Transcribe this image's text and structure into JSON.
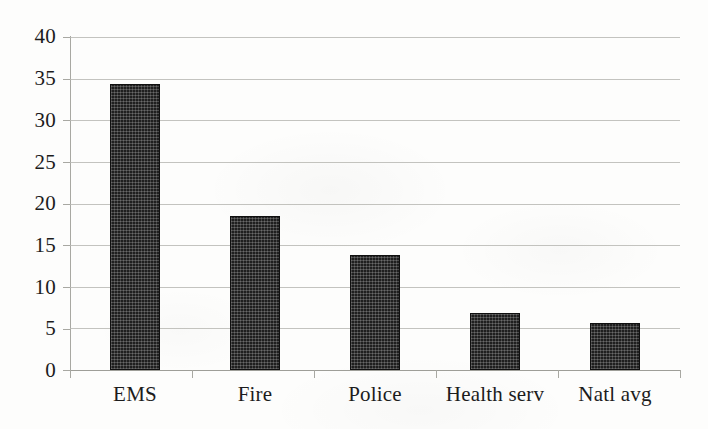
{
  "chart_data": {
    "type": "bar",
    "title": "",
    "subtitle": "",
    "xlabel": "",
    "ylabel": "",
    "categories": [
      "EMS",
      "Fire",
      "Police",
      "Health serv",
      "Natl avg"
    ],
    "values": [
      34.4,
      18.5,
      13.8,
      6.8,
      5.7
    ],
    "series": [
      {
        "name": "",
        "values": [
          34.4,
          18.5,
          13.8,
          6.8,
          5.7
        ]
      }
    ],
    "ylim": [
      0,
      40
    ],
    "ytick_values": [
      0,
      5,
      10,
      15,
      20,
      25,
      30,
      35,
      40
    ],
    "ytick_labels": [
      "0",
      "5",
      "10",
      "15",
      "20",
      "25",
      "30",
      "35",
      "40"
    ],
    "ytick_step": 5,
    "grid": true,
    "grid_axis": "y",
    "legend": false,
    "legend_position": "none",
    "annotations": [],
    "bar_color": "#1f1f1f",
    "bar_pattern": "crosshatch",
    "background_color": "#fdfdfc",
    "gridline_color": "#b9b9b4",
    "axis_color": "#9e9e98",
    "text_color": "#1c1c1c"
  }
}
